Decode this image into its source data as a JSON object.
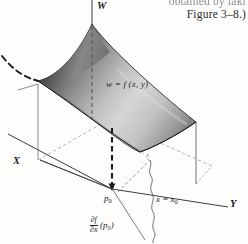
{
  "figure": {
    "title_caption": {
      "line1_partial": "obtained by taki",
      "line2": "Figure 3–8.)"
    },
    "axes": {
      "vertical_label": "W",
      "left_label": "X",
      "right_label": "Y"
    },
    "surface": {
      "equation_label": "w = f (x, y)",
      "shading": "grayscale-gradient",
      "fill_dark": "#3a3a3a",
      "fill_light": "#e8e8e8",
      "stroke": "#1a1a1a"
    },
    "annotations": {
      "point_label": "p",
      "point_subscript": "0",
      "plane_label": "x = x",
      "plane_subscript": "0",
      "derivative_numerator": "∂f",
      "derivative_denominator": "∂x",
      "derivative_argument": "(p₀)"
    },
    "colors": {
      "background": "#fdfdfc",
      "line": "#3d3d3d",
      "dashed_line": "#555555",
      "text": "#1b1b1b"
    }
  }
}
